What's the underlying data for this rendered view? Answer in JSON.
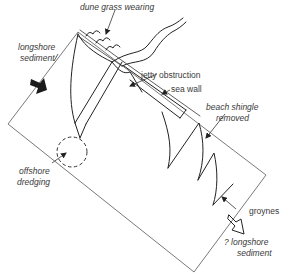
{
  "diagram": {
    "labels": {
      "dune_grass": "dune grass wearing",
      "longshore_1": "longshore",
      "longshore_2": "sediment",
      "jetty": "jetty obstruction",
      "sea_wall": "sea wall",
      "shingle_1": "beach shingle",
      "shingle_2": "removed",
      "offshore_1": "offshore",
      "offshore_2": "dredging",
      "groynes": "groynes",
      "q_longshore_1": "? longshore",
      "q_longshore_2": "sediment"
    },
    "colors": {
      "ink": "#222222",
      "frame": "#6a6a6a",
      "text": "#3a3a3a",
      "background": "#ffffff"
    },
    "icons": {
      "incoming_sediment": "filled-arrow-icon",
      "outgoing_sediment": "outline-arrow-icon"
    }
  }
}
